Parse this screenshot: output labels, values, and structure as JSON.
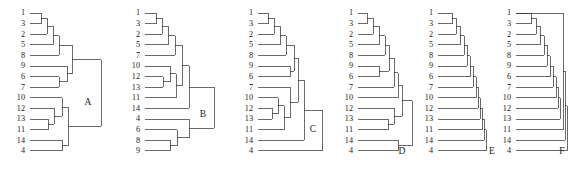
{
  "figure": {
    "type": "dendrogram-panel-set",
    "panel_count": 6,
    "panel_labels": [
      "A",
      "B",
      "C",
      "D",
      "E",
      "F"
    ],
    "background_color": "#ffffff",
    "line_color": "#2b2b2b",
    "text_color": "#1a1a1a",
    "taxa_count": 14,
    "taxa": [
      "1",
      "2",
      "3",
      "4",
      "5",
      "6",
      "7",
      "8",
      "9",
      "10",
      "11",
      "12",
      "13",
      "14"
    ]
  },
  "chart_data": {
    "type": "diagram",
    "title": "",
    "xlabel": "",
    "ylabel": "",
    "panels": [
      {
        "label": "A",
        "origin_x": 22,
        "leaf_x": 30,
        "label_x": 27,
        "root_x": 101,
        "leaves": [
          "1",
          "3",
          "2",
          "5",
          "8",
          "9",
          "6",
          "7",
          "10",
          "12",
          "13",
          "11",
          "14",
          "4"
        ],
        "nodes": [
          {
            "id": "n1",
            "children": [
              "1",
              "3"
            ],
            "x": 41
          },
          {
            "id": "n2",
            "children": [
              "n1",
              "2"
            ],
            "x": 47
          },
          {
            "id": "n3",
            "children": [
              "n2",
              "5"
            ],
            "x": 53
          },
          {
            "id": "n4",
            "children": [
              "n3",
              "8"
            ],
            "x": 59
          },
          {
            "id": "n5",
            "children": [
              "6",
              "7"
            ],
            "x": 59
          },
          {
            "id": "n6",
            "children": [
              "9",
              "n5"
            ],
            "x": 67
          },
          {
            "id": "n7",
            "children": [
              "n4",
              "n6"
            ],
            "x": 72
          },
          {
            "id": "n8",
            "children": [
              "13",
              "11"
            ],
            "x": 48
          },
          {
            "id": "n9",
            "children": [
              "12",
              "n8"
            ],
            "x": 54
          },
          {
            "id": "n10",
            "children": [
              "10",
              "n9"
            ],
            "x": 62
          },
          {
            "id": "n11",
            "children": [
              "14",
              "4"
            ],
            "x": 62
          },
          {
            "id": "n12",
            "children": [
              "n10",
              "n11"
            ],
            "x": 68
          },
          {
            "id": "root",
            "children": [
              "n7",
              "n12"
            ],
            "x": 101
          }
        ]
      },
      {
        "label": "B",
        "origin_x": 137,
        "leaf_x": 145,
        "label_x": 142,
        "root_x": 214,
        "leaves": [
          "1",
          "3",
          "2",
          "5",
          "7",
          "10",
          "12",
          "13",
          "11",
          "14",
          "4",
          "6",
          "8",
          "9"
        ],
        "nodes": [
          {
            "id": "n1",
            "children": [
              "1",
              "3"
            ],
            "x": 156
          },
          {
            "id": "n2",
            "children": [
              "n1",
              "2"
            ],
            "x": 162
          },
          {
            "id": "n3",
            "children": [
              "n2",
              "5"
            ],
            "x": 168
          },
          {
            "id": "n4",
            "children": [
              "n3",
              "7"
            ],
            "x": 175
          },
          {
            "id": "n5",
            "children": [
              "12",
              "13"
            ],
            "x": 163
          },
          {
            "id": "n6",
            "children": [
              "10",
              "n5"
            ],
            "x": 170
          },
          {
            "id": "n7",
            "children": [
              "n6",
              "11"
            ],
            "x": 176
          },
          {
            "id": "n8",
            "children": [
              "n4",
              "n7"
            ],
            "x": 182
          },
          {
            "id": "n9",
            "children": [
              "n8",
              "14"
            ],
            "x": 189
          },
          {
            "id": "n10",
            "children": [
              "8",
              "9"
            ],
            "x": 170
          },
          {
            "id": "n11",
            "children": [
              "6",
              "n10"
            ],
            "x": 177
          },
          {
            "id": "n12",
            "children": [
              "4",
              "n11"
            ],
            "x": 189
          },
          {
            "id": "root",
            "children": [
              "n9",
              "n12"
            ],
            "x": 214
          }
        ]
      },
      {
        "label": "C",
        "origin_x": 250,
        "leaf_x": 258,
        "label_x": 255,
        "root_x": 322,
        "leaves": [
          "1",
          "3",
          "2",
          "5",
          "8",
          "9",
          "6",
          "7",
          "10",
          "12",
          "13",
          "11",
          "14",
          "4"
        ],
        "nodes": [
          {
            "id": "n1",
            "children": [
              "1",
              "3"
            ],
            "x": 268
          },
          {
            "id": "n2",
            "children": [
              "n1",
              "2"
            ],
            "x": 274
          },
          {
            "id": "n3",
            "children": [
              "n2",
              "5"
            ],
            "x": 280
          },
          {
            "id": "n4",
            "children": [
              "n3",
              "8"
            ],
            "x": 286
          },
          {
            "id": "n5",
            "children": [
              "9",
              "6"
            ],
            "x": 290
          },
          {
            "id": "n6",
            "children": [
              "n4",
              "n5"
            ],
            "x": 294
          },
          {
            "id": "n7",
            "children": [
              "12",
              "13"
            ],
            "x": 272
          },
          {
            "id": "n8",
            "children": [
              "10",
              "n7"
            ],
            "x": 278
          },
          {
            "id": "n9",
            "children": [
              "n8",
              "11"
            ],
            "x": 284
          },
          {
            "id": "n10",
            "children": [
              "7",
              "n9"
            ],
            "x": 290
          },
          {
            "id": "n11",
            "children": [
              "n6",
              "n10"
            ],
            "x": 298
          },
          {
            "id": "n12",
            "children": [
              "n11",
              "14"
            ],
            "x": 304
          },
          {
            "id": "root",
            "children": [
              "n12",
              "4"
            ],
            "x": 322
          }
        ]
      },
      {
        "label": "D",
        "origin_x": 350,
        "leaf_x": 358,
        "label_x": 355,
        "root_x": 412,
        "leaves": [
          "1",
          "3",
          "2",
          "5",
          "8",
          "9",
          "6",
          "7",
          "10",
          "12",
          "13",
          "11",
          "14",
          "4"
        ],
        "nodes": [
          {
            "id": "n1",
            "children": [
              "1",
              "3"
            ],
            "x": 367
          },
          {
            "id": "n2",
            "children": [
              "n1",
              "2"
            ],
            "x": 373
          },
          {
            "id": "n3",
            "children": [
              "n2",
              "5"
            ],
            "x": 379
          },
          {
            "id": "n4",
            "children": [
              "n3",
              "8"
            ],
            "x": 385
          },
          {
            "id": "n5",
            "children": [
              "9",
              "6"
            ],
            "x": 379
          },
          {
            "id": "n6",
            "children": [
              "n4",
              "n5"
            ],
            "x": 389
          },
          {
            "id": "n7",
            "children": [
              "n6",
              "7"
            ],
            "x": 394
          },
          {
            "id": "n8",
            "children": [
              "n7",
              "10"
            ],
            "x": 398
          },
          {
            "id": "n9",
            "children": [
              "13",
              "11"
            ],
            "x": 388
          },
          {
            "id": "n10",
            "children": [
              "12",
              "n9"
            ],
            "x": 394
          },
          {
            "id": "n11",
            "children": [
              "n8",
              "n10"
            ],
            "x": 402
          },
          {
            "id": "n12",
            "children": [
              "14",
              "4"
            ],
            "x": 398
          },
          {
            "id": "root",
            "children": [
              "n11",
              "n12"
            ],
            "x": 412
          }
        ]
      },
      {
        "label": "E",
        "origin_x": 430,
        "leaf_x": 438,
        "label_x": 435,
        "root_x": 486,
        "leaves": [
          "1",
          "3",
          "2",
          "5",
          "8",
          "9",
          "6",
          "7",
          "10",
          "12",
          "13",
          "11",
          "14",
          "4"
        ],
        "nodes": [
          {
            "id": "n1",
            "children": [
              "1",
              "3"
            ],
            "x": 452
          },
          {
            "id": "n2",
            "children": [
              "n1",
              "2"
            ],
            "x": 456
          },
          {
            "id": "n3",
            "children": [
              "n2",
              "5"
            ],
            "x": 460
          },
          {
            "id": "n4",
            "children": [
              "n3",
              "8"
            ],
            "x": 464
          },
          {
            "id": "n5",
            "children": [
              "n4",
              "9"
            ],
            "x": 467
          },
          {
            "id": "n6",
            "children": [
              "n5",
              "6"
            ],
            "x": 470
          },
          {
            "id": "n7",
            "children": [
              "n6",
              "7"
            ],
            "x": 473
          },
          {
            "id": "n8",
            "children": [
              "n7",
              "10"
            ],
            "x": 476
          },
          {
            "id": "n9",
            "children": [
              "n8",
              "12"
            ],
            "x": 478
          },
          {
            "id": "n10",
            "children": [
              "n9",
              "13"
            ],
            "x": 480
          },
          {
            "id": "n11",
            "children": [
              "n10",
              "11"
            ],
            "x": 482
          },
          {
            "id": "n12",
            "children": [
              "n11",
              "14"
            ],
            "x": 484
          },
          {
            "id": "root",
            "children": [
              "n12",
              "4"
            ],
            "x": 486
          }
        ]
      },
      {
        "label": "F",
        "origin_x": 508,
        "leaf_x": 516,
        "label_x": 513,
        "root_x": 567,
        "leaves": [
          "1",
          "3",
          "2",
          "5",
          "8",
          "9",
          "6",
          "7",
          "10",
          "12",
          "13",
          "11",
          "14",
          "4"
        ],
        "nodes": [
          {
            "id": "n1",
            "children": [
              "1",
              "3"
            ],
            "x": 531
          },
          {
            "id": "n2",
            "children": [
              "n1",
              "2"
            ],
            "x": 536
          },
          {
            "id": "n3",
            "children": [
              "n2",
              "5"
            ],
            "x": 540
          },
          {
            "id": "n4",
            "children": [
              "n3",
              "8"
            ],
            "x": 544
          },
          {
            "id": "n5",
            "children": [
              "n4",
              "9"
            ],
            "x": 547
          },
          {
            "id": "n6",
            "children": [
              "n5",
              "6"
            ],
            "x": 550
          },
          {
            "id": "n7",
            "children": [
              "n6",
              "7"
            ],
            "x": 553
          },
          {
            "id": "n8",
            "children": [
              "n7",
              "10"
            ],
            "x": 556
          },
          {
            "id": "n9",
            "children": [
              "n8",
              "12"
            ],
            "x": 558
          },
          {
            "id": "n10",
            "children": [
              "n9",
              "13"
            ],
            "x": 560
          },
          {
            "id": "n11",
            "children": [
              "13x",
              "11"
            ],
            "x": 563
          },
          {
            "id": "n12",
            "children": [
              "n11",
              "14"
            ],
            "x": 565
          },
          {
            "id": "root",
            "children": [
              "n12",
              "4"
            ],
            "x": 567
          }
        ]
      }
    ],
    "panel_label_positions": [
      {
        "label": "A",
        "x": 88,
        "y": 103
      },
      {
        "label": "B",
        "x": 203,
        "y": 115
      },
      {
        "label": "C",
        "x": 313,
        "y": 130
      },
      {
        "label": "D",
        "x": 402,
        "y": 152
      },
      {
        "label": "E",
        "x": 492,
        "y": 152
      },
      {
        "label": "F",
        "x": 562,
        "y": 152
      }
    ],
    "layout": {
      "leaf_top_y": 13,
      "leaf_spacing": 10.6,
      "label_offset_x": -2
    }
  }
}
